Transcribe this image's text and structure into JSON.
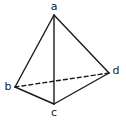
{
  "diagram": {
    "stroke_color": "#1a1a1a",
    "vertices": {
      "a": {
        "label": "a",
        "x": 54,
        "y": 15,
        "lx": 54,
        "ly": 10
      },
      "b": {
        "label": "b",
        "x": 15,
        "y": 87,
        "lx": 8,
        "ly": 90
      },
      "c": {
        "label": "c",
        "x": 54,
        "y": 104,
        "lx": 54,
        "ly": 116
      },
      "d": {
        "label": "d",
        "x": 109,
        "y": 73,
        "lx": 116,
        "ly": 74
      }
    },
    "edges": [
      {
        "from": "a",
        "to": "b",
        "style": "solid"
      },
      {
        "from": "a",
        "to": "c",
        "style": "solid"
      },
      {
        "from": "a",
        "to": "d",
        "style": "solid"
      },
      {
        "from": "b",
        "to": "c",
        "style": "solid"
      },
      {
        "from": "c",
        "to": "d",
        "style": "solid"
      },
      {
        "from": "b",
        "to": "d",
        "style": "dashed"
      }
    ]
  }
}
